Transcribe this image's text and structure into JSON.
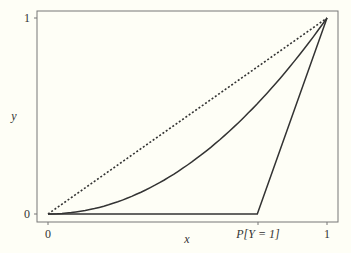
{
  "chart_data": {
    "type": "line",
    "title": "",
    "xlabel": "x",
    "ylabel": "y",
    "xlim": [
      0,
      1
    ],
    "ylim": [
      0,
      1
    ],
    "x_ticks": [
      {
        "value": 0,
        "label": "0"
      },
      {
        "value": 0.75,
        "label": "P[Y = 1]"
      },
      {
        "value": 1,
        "label": "1"
      }
    ],
    "y_ticks": [
      {
        "value": 0,
        "label": "0"
      },
      {
        "value": 1,
        "label": "1"
      }
    ],
    "grid": false,
    "legend": null,
    "series": [
      {
        "name": "diagonal",
        "style": "dotted",
        "x": [
          0,
          1
        ],
        "y": [
          0,
          1
        ]
      },
      {
        "name": "curve",
        "style": "solid",
        "x": [
          0,
          0.1,
          0.2,
          0.3,
          0.4,
          0.5,
          0.6,
          0.7,
          0.8,
          0.9,
          1.0
        ],
        "y": [
          0,
          0.01,
          0.04,
          0.09,
          0.16,
          0.25,
          0.36,
          0.49,
          0.64,
          0.81,
          1.0
        ]
      },
      {
        "name": "extreme",
        "style": "solid",
        "x": [
          0,
          0.75,
          1
        ],
        "y": [
          0,
          0,
          1
        ]
      }
    ]
  },
  "labels": {
    "x_axis": "x",
    "y_axis": "y",
    "x_tick_0": "0",
    "x_tick_p": "P[Y = 1]",
    "x_tick_1": "1",
    "y_tick_0": "0",
    "y_tick_1": "1"
  }
}
